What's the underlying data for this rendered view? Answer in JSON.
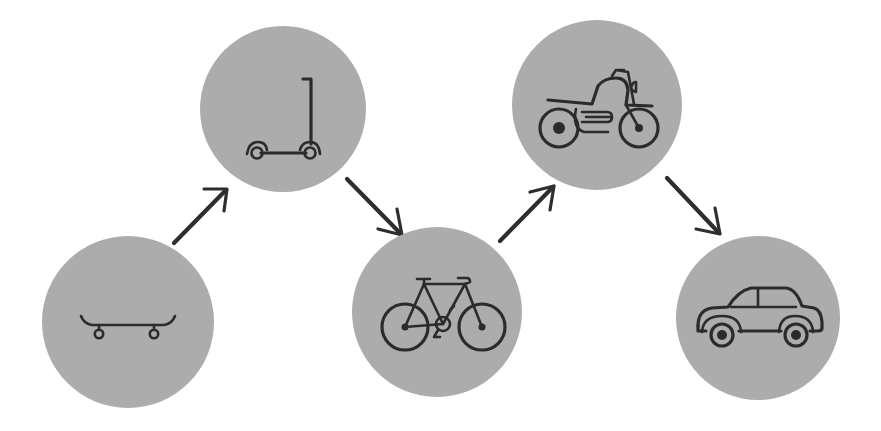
{
  "diagram": {
    "type": "progression-flow",
    "colors": {
      "background": "#ffffff",
      "circle_fill": "#acacac",
      "icon_stroke": "#2b2b2b",
      "arrow": "#2e2e2e"
    },
    "nodes": [
      {
        "id": "skateboard",
        "label": "Skateboard",
        "icon": "skateboard-icon",
        "cx": 128,
        "cy": 322,
        "r": 86
      },
      {
        "id": "scooter",
        "label": "Kick scooter",
        "icon": "scooter-icon",
        "cx": 283,
        "cy": 109,
        "r": 83
      },
      {
        "id": "bicycle",
        "label": "Bicycle",
        "icon": "bicycle-icon",
        "cx": 437,
        "cy": 312,
        "r": 85
      },
      {
        "id": "motorcycle",
        "label": "Motorcycle",
        "icon": "motorcycle-icon",
        "cx": 597,
        "cy": 105,
        "r": 85
      },
      {
        "id": "car",
        "label": "Car",
        "icon": "car-icon",
        "cx": 758,
        "cy": 318,
        "r": 82
      }
    ],
    "edges": [
      {
        "from": "skateboard",
        "to": "scooter",
        "direction": "up-right"
      },
      {
        "from": "scooter",
        "to": "bicycle",
        "direction": "down-right"
      },
      {
        "from": "bicycle",
        "to": "motorcycle",
        "direction": "up-right"
      },
      {
        "from": "motorcycle",
        "to": "car",
        "direction": "down-right"
      }
    ]
  }
}
